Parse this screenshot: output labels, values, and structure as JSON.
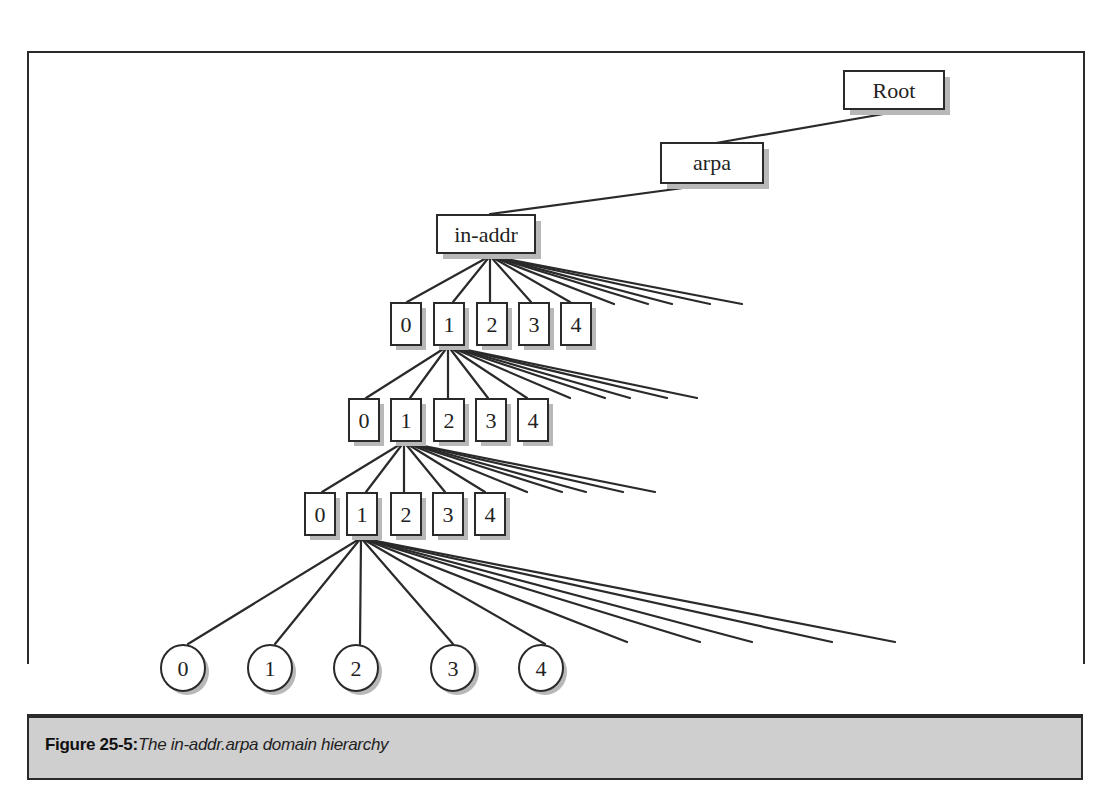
{
  "figure": {
    "label": "Figure 25-5:",
    "caption": "The in-addr.arpa domain hierarchy"
  },
  "nodes": {
    "root": "Root",
    "arpa": "arpa",
    "in_addr": "in-addr",
    "level1": [
      "0",
      "1",
      "2",
      "3",
      "4"
    ],
    "level2": [
      "0",
      "1",
      "2",
      "3",
      "4"
    ],
    "level3": [
      "0",
      "1",
      "2",
      "3",
      "4"
    ],
    "leaves": [
      "0",
      "1",
      "2",
      "3",
      "4"
    ]
  },
  "colors": {
    "line": "#2a2a2a",
    "shadow": "#b8b8b8",
    "caption_bg": "#cfcfcf"
  }
}
